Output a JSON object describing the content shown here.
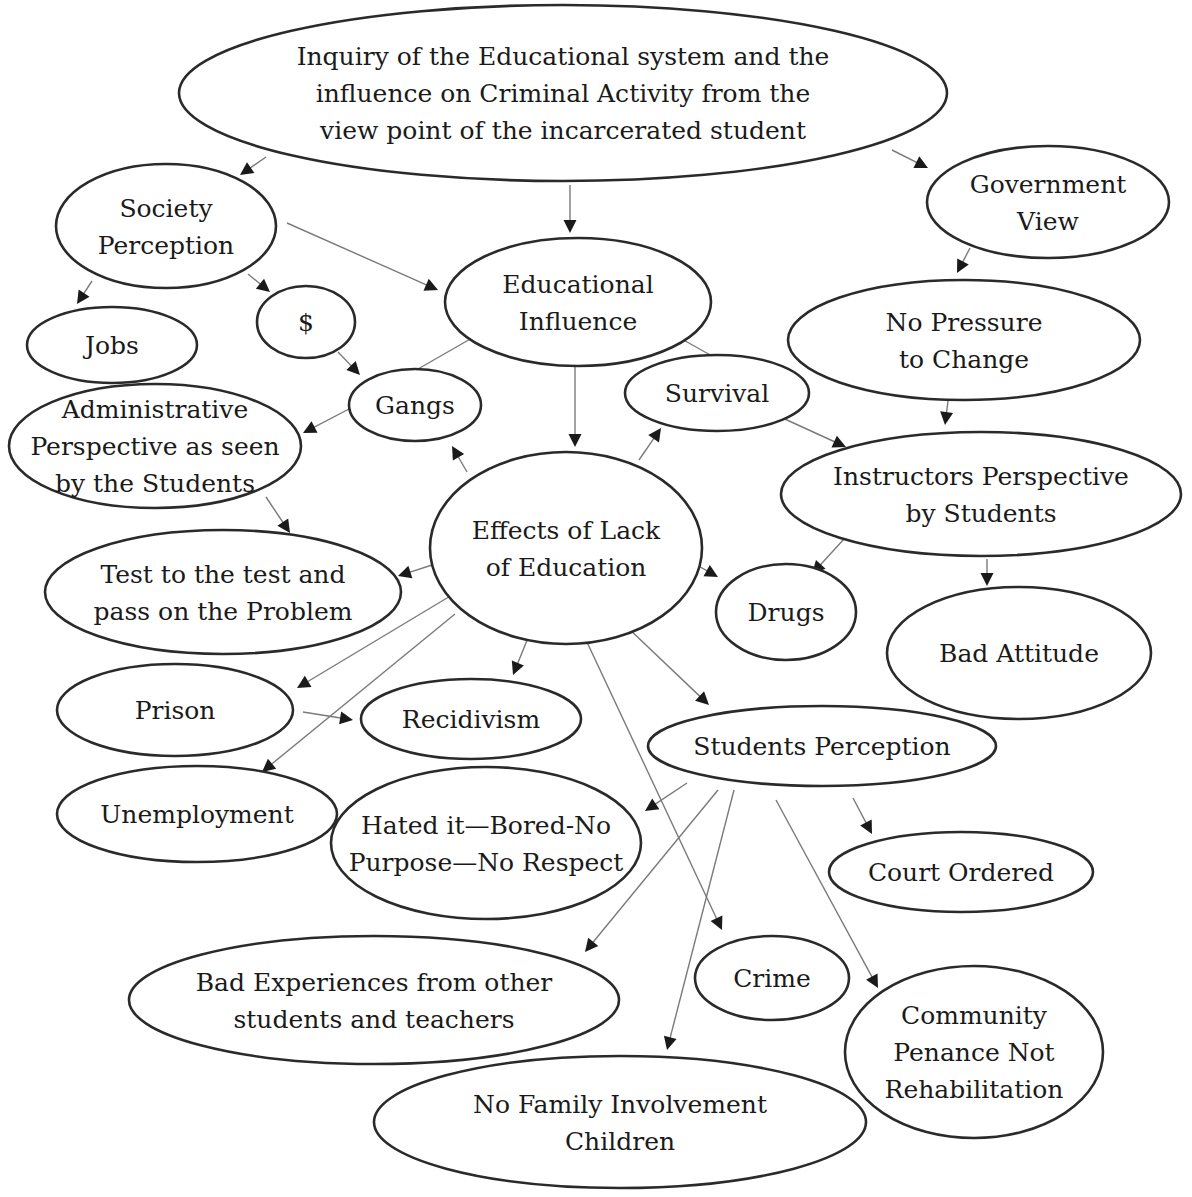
{
  "diagram": {
    "nodes": [
      {
        "id": "root",
        "lines": [
          "Inquiry of the Educational system and the",
          "influence on Criminal Activity from the",
          "view point of the incarcerated student"
        ],
        "cx": 563,
        "cy": 93,
        "rx": 384,
        "ry": 88
      },
      {
        "id": "society",
        "lines": [
          "Society",
          "Perception"
        ],
        "cx": 166,
        "cy": 226,
        "rx": 110,
        "ry": 62
      },
      {
        "id": "government",
        "lines": [
          "Government",
          "View"
        ],
        "cx": 1048,
        "cy": 202,
        "rx": 121,
        "ry": 56
      },
      {
        "id": "educational-influence",
        "lines": [
          "Educational",
          "Influence"
        ],
        "cx": 578,
        "cy": 302,
        "rx": 133,
        "ry": 64
      },
      {
        "id": "jobs",
        "lines": [
          "Jobs"
        ],
        "cx": 112,
        "cy": 345,
        "rx": 85,
        "ry": 38
      },
      {
        "id": "money",
        "lines": [
          "$"
        ],
        "cx": 306,
        "cy": 322,
        "rx": 49,
        "ry": 36
      },
      {
        "id": "no-pressure",
        "lines": [
          "No Pressure",
          "to Change"
        ],
        "cx": 964,
        "cy": 340,
        "rx": 176,
        "ry": 60
      },
      {
        "id": "survival",
        "lines": [
          "Survival"
        ],
        "cx": 717,
        "cy": 393,
        "rx": 92,
        "ry": 38
      },
      {
        "id": "gangs",
        "lines": [
          "Gangs"
        ],
        "cx": 415,
        "cy": 405,
        "rx": 66,
        "ry": 36
      },
      {
        "id": "administrative",
        "lines": [
          "Administrative",
          "Perspective as seen",
          "by the Students"
        ],
        "cx": 155,
        "cy": 446,
        "rx": 146,
        "ry": 62
      },
      {
        "id": "instructors",
        "lines": [
          "Instructors Perspective",
          "by Students"
        ],
        "cx": 981,
        "cy": 494,
        "rx": 200,
        "ry": 62
      },
      {
        "id": "effects",
        "lines": [
          "Effects of Lack",
          "of Education"
        ],
        "cx": 566,
        "cy": 548,
        "rx": 136,
        "ry": 96
      },
      {
        "id": "test",
        "lines": [
          "Test to the test and",
          "pass on the Problem"
        ],
        "cx": 223,
        "cy": 592,
        "rx": 178,
        "ry": 62
      },
      {
        "id": "drugs",
        "lines": [
          "Drugs"
        ],
        "cx": 786,
        "cy": 612,
        "rx": 70,
        "ry": 48
      },
      {
        "id": "bad-attitude",
        "lines": [
          "Bad Attitude"
        ],
        "cx": 1019,
        "cy": 653,
        "rx": 132,
        "ry": 66
      },
      {
        "id": "prison",
        "lines": [
          "Prison"
        ],
        "cx": 175,
        "cy": 710,
        "rx": 118,
        "ry": 46
      },
      {
        "id": "recidivism",
        "lines": [
          "Recidivism"
        ],
        "cx": 471,
        "cy": 719,
        "rx": 110,
        "ry": 40
      },
      {
        "id": "students-perception",
        "lines": [
          "Students Perception"
        ],
        "cx": 822,
        "cy": 746,
        "rx": 174,
        "ry": 40
      },
      {
        "id": "unemployment",
        "lines": [
          "Unemployment"
        ],
        "cx": 197,
        "cy": 814,
        "rx": 140,
        "ry": 48
      },
      {
        "id": "hated",
        "lines": [
          "Hated it—Bored-No",
          "Purpose—No Respect"
        ],
        "cx": 486,
        "cy": 843,
        "rx": 155,
        "ry": 76
      },
      {
        "id": "court-ordered",
        "lines": [
          "Court Ordered"
        ],
        "cx": 961,
        "cy": 872,
        "rx": 132,
        "ry": 40
      },
      {
        "id": "bad-experiences",
        "lines": [
          "Bad Experiences from other",
          "students and teachers"
        ],
        "cx": 374,
        "cy": 1000,
        "rx": 245,
        "ry": 64
      },
      {
        "id": "crime",
        "lines": [
          "Crime"
        ],
        "cx": 772,
        "cy": 978,
        "rx": 77,
        "ry": 42
      },
      {
        "id": "community",
        "lines": [
          "Community",
          "Penance Not",
          "Rehabilitation"
        ],
        "cx": 974,
        "cy": 1052,
        "rx": 129,
        "ry": 86
      },
      {
        "id": "no-family",
        "lines": [
          "No Family Involvement",
          "Children"
        ],
        "cx": 620,
        "cy": 1122,
        "rx": 246,
        "ry": 66
      }
    ],
    "edges": [
      {
        "from": "root",
        "to": "society",
        "x1": 266,
        "y1": 157,
        "x2": 240,
        "y2": 175,
        "arrow": true
      },
      {
        "from": "root",
        "to": "educational-influence",
        "x1": 570,
        "y1": 185,
        "x2": 570,
        "y2": 233,
        "arrow": true
      },
      {
        "from": "root",
        "to": "government",
        "x1": 892,
        "y1": 150,
        "x2": 928,
        "y2": 168,
        "arrow": true
      },
      {
        "from": "society",
        "to": "jobs",
        "x1": 92,
        "y1": 281,
        "x2": 77,
        "y2": 304,
        "arrow": true
      },
      {
        "from": "society",
        "to": "money",
        "x1": 248,
        "y1": 274,
        "x2": 270,
        "y2": 292,
        "arrow": true
      },
      {
        "from": "society",
        "to": "educational-influence",
        "x1": 287,
        "y1": 223,
        "x2": 438,
        "y2": 290,
        "arrow": true
      },
      {
        "from": "money",
        "to": "gangs",
        "x1": 338,
        "y1": 352,
        "x2": 360,
        "y2": 375,
        "arrow": true
      },
      {
        "from": "educational-influence",
        "to": "gangs",
        "x1": 472,
        "y1": 338,
        "x2": 418,
        "y2": 369,
        "arrow": false
      },
      {
        "from": "educational-influence",
        "to": "effects",
        "x1": 575,
        "y1": 365,
        "x2": 575,
        "y2": 447,
        "arrow": true
      },
      {
        "from": "educational-influence",
        "to": "instructors",
        "x1": 680,
        "y1": 338,
        "x2": 712,
        "y2": 356,
        "arrow": false
      },
      {
        "from": "gangs",
        "to": "administrative",
        "x1": 349,
        "y1": 409,
        "x2": 303,
        "y2": 433,
        "arrow": true
      },
      {
        "from": "government",
        "to": "no-pressure",
        "x1": 970,
        "y1": 248,
        "x2": 957,
        "y2": 273,
        "arrow": true
      },
      {
        "from": "no-pressure",
        "to": "instructors",
        "x1": 948,
        "y1": 401,
        "x2": 945,
        "y2": 425,
        "arrow": true
      },
      {
        "from": "survival",
        "to": "instructors",
        "x1": 776,
        "y1": 415,
        "x2": 846,
        "y2": 447,
        "arrow": true
      },
      {
        "from": "effects",
        "to": "gangs",
        "x1": 467,
        "y1": 472,
        "x2": 452,
        "y2": 446,
        "arrow": true
      },
      {
        "from": "effects",
        "to": "survival",
        "x1": 639,
        "y1": 460,
        "x2": 661,
        "y2": 428,
        "arrow": true
      },
      {
        "from": "administrative",
        "to": "test",
        "x1": 266,
        "y1": 497,
        "x2": 290,
        "y2": 533,
        "arrow": true
      },
      {
        "from": "effects",
        "to": "test",
        "x1": 432,
        "y1": 565,
        "x2": 398,
        "y2": 576,
        "arrow": true
      },
      {
        "from": "effects",
        "to": "drugs",
        "x1": 693,
        "y1": 563,
        "x2": 718,
        "y2": 577,
        "arrow": true
      },
      {
        "from": "instructors",
        "to": "drugs",
        "x1": 844,
        "y1": 539,
        "x2": 812,
        "y2": 574,
        "arrow": true
      },
      {
        "from": "instructors",
        "to": "bad-attitude",
        "x1": 987,
        "y1": 559,
        "x2": 987,
        "y2": 586,
        "arrow": true
      },
      {
        "from": "effects",
        "to": "prison",
        "x1": 452,
        "y1": 595,
        "x2": 297,
        "y2": 688,
        "arrow": true
      },
      {
        "from": "effects",
        "to": "unemployment",
        "x1": 455,
        "y1": 614,
        "x2": 262,
        "y2": 772,
        "arrow": true
      },
      {
        "from": "effects",
        "to": "recidivism",
        "x1": 532,
        "y1": 628,
        "x2": 513,
        "y2": 675,
        "arrow": true
      },
      {
        "from": "effects",
        "to": "crime",
        "x1": 586,
        "y1": 640,
        "x2": 722,
        "y2": 930,
        "arrow": true
      },
      {
        "from": "effects",
        "to": "students-perception",
        "x1": 627,
        "y1": 627,
        "x2": 709,
        "y2": 705,
        "arrow": true
      },
      {
        "from": "prison",
        "to": "recidivism",
        "x1": 303,
        "y1": 712,
        "x2": 353,
        "y2": 720,
        "arrow": true
      },
      {
        "from": "students-perception",
        "to": "hated",
        "x1": 687,
        "y1": 783,
        "x2": 645,
        "y2": 811,
        "arrow": true
      },
      {
        "from": "students-perception",
        "to": "bad-experiences",
        "x1": 718,
        "y1": 790,
        "x2": 585,
        "y2": 952,
        "arrow": true
      },
      {
        "from": "students-perception",
        "to": "no-family",
        "x1": 734,
        "y1": 790,
        "x2": 667,
        "y2": 1050,
        "arrow": true
      },
      {
        "from": "students-perception",
        "to": "community",
        "x1": 776,
        "y1": 800,
        "x2": 878,
        "y2": 988,
        "arrow": true
      },
      {
        "from": "students-perception",
        "to": "court-ordered",
        "x1": 853,
        "y1": 798,
        "x2": 872,
        "y2": 834,
        "arrow": true
      }
    ]
  }
}
